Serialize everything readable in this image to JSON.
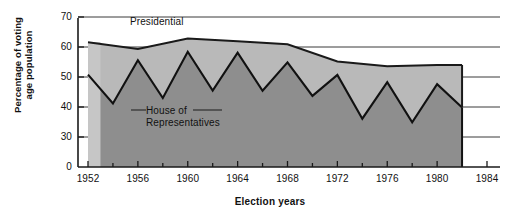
{
  "chart_data": {
    "type": "area",
    "title": "",
    "xlabel": "Election years",
    "ylabel": "Percentage of voting age population",
    "ylabel_line1": "Percentage of voting",
    "ylabel_line2": "age population",
    "xlim": [
      1952,
      1984
    ],
    "ylim": [
      25,
      72
    ],
    "grid": true,
    "legend_position": "in-plot annotations",
    "y_ticks": [
      "70",
      "60",
      "50",
      "40",
      "30",
      "0"
    ],
    "y_tick_values": [
      70,
      60,
      50,
      40,
      30,
      25
    ],
    "x_ticks": [
      "1952",
      "1956",
      "1960",
      "1964",
      "1968",
      "1972",
      "1976",
      "1980",
      "1984"
    ],
    "x_tick_values": [
      1952,
      1956,
      1960,
      1964,
      1968,
      1972,
      1976,
      1980,
      1984
    ],
    "x_minor_ticks": [
      1954,
      1958,
      1962,
      1966,
      1970,
      1974,
      1978,
      1982
    ],
    "axis_break": "y-axis is broken between 0 and 30",
    "series": [
      {
        "name": "Presidential",
        "color": "#b5b5b5",
        "x": [
          1952,
          1956,
          1960,
          1964,
          1968,
          1972,
          1976,
          1980
        ],
        "values": [
          61.6,
          59.3,
          62.8,
          61.9,
          60.9,
          55.2,
          53.6,
          54.0
        ]
      },
      {
        "name": "House of Representatives",
        "color": "#8a8a8a",
        "x": [
          1952,
          1954,
          1956,
          1958,
          1960,
          1962,
          1964,
          1966,
          1968,
          1970,
          1972,
          1974,
          1976,
          1978,
          1980,
          1982
        ],
        "values": [
          50.8,
          41.2,
          55.6,
          43.0,
          58.4,
          45.5,
          58.1,
          45.4,
          54.9,
          43.7,
          50.7,
          36.1,
          48.3,
          34.9,
          47.6,
          39.8
        ]
      }
    ],
    "annotations": [
      {
        "text": "Presidential",
        "x": 1955,
        "y": 67
      },
      {
        "text": "House of Representatives",
        "text_line1": "House of",
        "text_line2": "Representatives",
        "x": 1956,
        "y": 40
      }
    ]
  },
  "axis": {
    "y_title_line1": "Percentage of voting",
    "y_title_line2": "age population",
    "x_title": "Election years"
  }
}
